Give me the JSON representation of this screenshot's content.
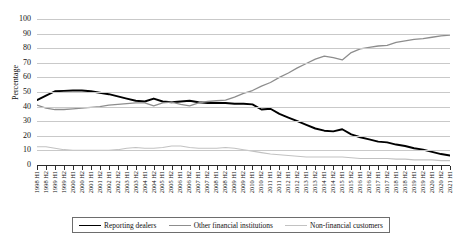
{
  "chart_data": {
    "type": "line",
    "title": "",
    "xlabel": "",
    "ylabel": "Percentage",
    "ylim": [
      0,
      100
    ],
    "ytick_step": 10,
    "yticks": [
      0,
      10,
      20,
      30,
      40,
      50,
      60,
      70,
      80,
      90,
      100
    ],
    "grid": true,
    "legend_position": "bottom",
    "categories": [
      "1998 H1",
      "1998 H2",
      "1999 H1",
      "1999 H2",
      "2000 H1",
      "2000 H2",
      "2001 H1",
      "2001 H2",
      "2002 H1",
      "2002 H2",
      "2003 H1",
      "2003 H2",
      "2004 H1",
      "2004 H2",
      "2005 H1",
      "2005 H2",
      "2006 H1",
      "2006 H2",
      "2007 H1",
      "2007 H2",
      "2008 H1",
      "2008 H2",
      "2009 H1",
      "2009 H2",
      "2010 H1",
      "2010 H2",
      "2011 H1",
      "2011 H2",
      "2012 H1",
      "2012 H2",
      "2013 H1",
      "2013 H2",
      "2014 H1",
      "2014 H2",
      "2015 H1",
      "2015 H2",
      "2016 H1",
      "2016 H2",
      "2017 H1",
      "2017 H2",
      "2018 H1",
      "2018 H2",
      "2019 H1",
      "2019 H2",
      "2020 H1",
      "2020 H2",
      "2021 H1"
    ],
    "series": [
      {
        "name": "Reporting dealers",
        "color": "#000000",
        "width": 1.9,
        "values": [
          44.5,
          47.5,
          50.5,
          50.8,
          51.0,
          51.0,
          50.5,
          49.5,
          48.5,
          47.0,
          45.5,
          44.0,
          43.5,
          45.5,
          43.5,
          43.0,
          43.5,
          44.0,
          43.0,
          42.5,
          42.5,
          42.5,
          42.0,
          42.0,
          41.5,
          38.0,
          38.5,
          35.0,
          32.5,
          30.0,
          27.5,
          25.0,
          23.5,
          23.0,
          24.5,
          21.0,
          19.0,
          17.5,
          16.0,
          15.5,
          14.0,
          13.0,
          11.5,
          10.5,
          9.0,
          7.5,
          6.5
        ]
      },
      {
        "name": "Other financial institutions",
        "color": "#8d8d8d",
        "width": 1.3,
        "values": [
          41.0,
          39.0,
          38.0,
          38.0,
          38.5,
          39.0,
          39.5,
          40.0,
          41.0,
          41.5,
          42.0,
          42.5,
          42.5,
          40.5,
          42.5,
          43.0,
          41.5,
          40.5,
          42.5,
          43.5,
          44.0,
          44.5,
          46.5,
          49.0,
          51.0,
          54.0,
          56.5,
          60.0,
          63.0,
          66.5,
          69.5,
          72.5,
          74.5,
          73.5,
          72.0,
          77.0,
          79.5,
          80.5,
          81.5,
          82.0,
          84.0,
          85.0,
          86.0,
          86.5,
          87.5,
          88.5,
          89.0
        ]
      },
      {
        "name": "Non-financial customers",
        "color": "#c2c2c2",
        "width": 1.1,
        "values": [
          12.5,
          12.5,
          11.5,
          10.5,
          10.0,
          10.0,
          10.0,
          10.0,
          10.0,
          10.5,
          11.5,
          12.0,
          11.5,
          11.5,
          12.0,
          13.0,
          13.0,
          12.0,
          11.5,
          11.5,
          11.5,
          12.0,
          11.5,
          10.5,
          9.5,
          8.5,
          7.5,
          7.0,
          6.5,
          6.0,
          5.5,
          5.5,
          5.5,
          5.5,
          5.5,
          5.0,
          4.5,
          4.5,
          4.5,
          4.5,
          4.0,
          4.0,
          3.5,
          3.5,
          3.5,
          3.0,
          3.0
        ]
      }
    ]
  },
  "legend": {
    "items": [
      {
        "label": "Reporting dealers"
      },
      {
        "label": "Other financial institutions"
      },
      {
        "label": "Non-financial customers"
      }
    ]
  }
}
